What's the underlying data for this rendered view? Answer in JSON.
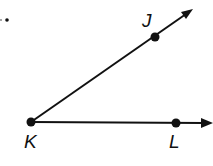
{
  "diagram": {
    "type": "angle",
    "problem_marker": ".",
    "vertex": {
      "label": "K",
      "x": 31,
      "y": 122
    },
    "points": [
      {
        "label": "J",
        "x": 155,
        "y": 37
      },
      {
        "label": "L",
        "x": 176,
        "y": 123
      }
    ],
    "rays": [
      {
        "name": "ray-KJ",
        "from": "K",
        "through": "J",
        "end_x": 192,
        "end_y": 10
      },
      {
        "name": "ray-KL",
        "from": "K",
        "through": "L",
        "end_x": 212,
        "end_y": 123
      }
    ],
    "colors": {
      "stroke": "#111111",
      "background": "#ffffff"
    }
  }
}
